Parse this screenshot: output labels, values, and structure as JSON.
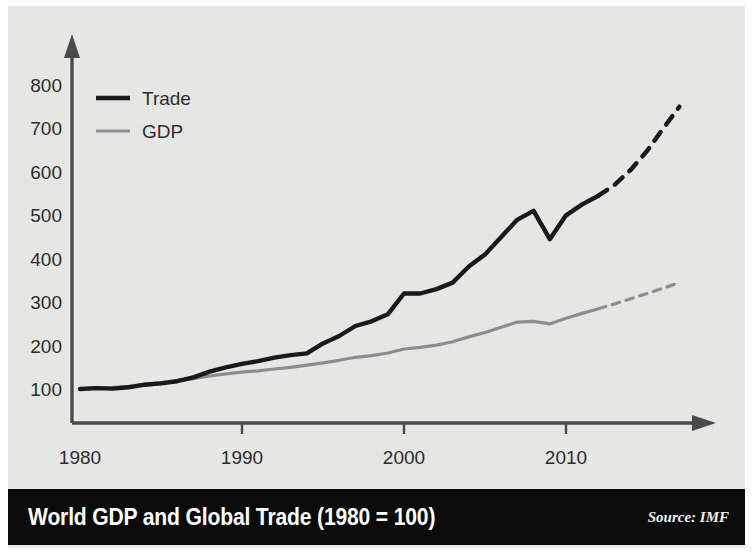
{
  "figure": {
    "title": "World GDP and Global Trade (1980 = 100)",
    "source": "Source: IMF",
    "background_color": "#e9e9e7",
    "title_bar_color": "#0b0b0b"
  },
  "chart_data": {
    "type": "line",
    "title": "World GDP and Global Trade (1980 = 100)",
    "subtitle": "",
    "xlabel": "",
    "ylabel": "",
    "xlim": [
      1980,
      2018
    ],
    "ylim": [
      0,
      850
    ],
    "xticks": [
      1980,
      1990,
      2000,
      2010
    ],
    "xtick_labels": [
      "1980",
      "1990",
      "2000",
      "2010"
    ],
    "yticks": [
      100,
      200,
      300,
      400,
      500,
      600,
      700,
      800
    ],
    "ytick_labels": [
      "100",
      "200",
      "300",
      "400",
      "500",
      "600",
      "700",
      "800"
    ],
    "grid": false,
    "legend_position": "upper-left",
    "note": "Index, 1980 = 100. Solid segments are historical; dashed segments are projections beginning 2012.",
    "series": [
      {
        "name": "Trade",
        "color": "#171717",
        "line_width": 4.2,
        "x": [
          1980,
          1981,
          1982,
          1983,
          1984,
          1985,
          1986,
          1987,
          1988,
          1989,
          1990,
          1991,
          1992,
          1993,
          1994,
          1995,
          1996,
          1997,
          1998,
          1999,
          2000,
          2001,
          2002,
          2003,
          2004,
          2005,
          2006,
          2007,
          2008,
          2009,
          2010,
          2011,
          2012
        ],
        "values": [
          100,
          101,
          100,
          102,
          108,
          111,
          116,
          124,
          134,
          144,
          152,
          158,
          167,
          178,
          181,
          196,
          207,
          225,
          233,
          244,
          265,
          268,
          274,
          288,
          312,
          320,
          323,
          330,
          340,
          352,
          362,
          372,
          385
        ],
        "dashed_from_index": 32
      },
      {
        "name": "GDP",
        "color": "#8e8e8e",
        "line_width": 3.0,
        "x": [
          1980,
          1981,
          1982,
          1983,
          1984,
          1985,
          1986,
          1987,
          1988,
          1989,
          1990,
          1991,
          1992,
          1993,
          1994,
          1995,
          1996,
          1997,
          1998,
          1999,
          2000,
          2001,
          2002,
          2003,
          2004,
          2005,
          2006,
          2007,
          2008,
          2009,
          2010,
          2011,
          2012
        ],
        "values": [
          100,
          101,
          101,
          103,
          107,
          110,
          113,
          117,
          122,
          126,
          130,
          132,
          135,
          138,
          142,
          146,
          150,
          155,
          158,
          163,
          169,
          172,
          176,
          182,
          190,
          197,
          205,
          213,
          216,
          213,
          224,
          232,
          240
        ],
        "dashed_from_index": 32
      }
    ],
    "trade_points": [
      {
        "year": 1980,
        "value": 100
      },
      {
        "year": 1981,
        "value": 102
      },
      {
        "year": 1982,
        "value": 101
      },
      {
        "year": 1983,
        "value": 104
      },
      {
        "year": 1984,
        "value": 110
      },
      {
        "year": 1985,
        "value": 113
      },
      {
        "year": 1986,
        "value": 118
      },
      {
        "year": 1987,
        "value": 127
      },
      {
        "year": 1988,
        "value": 140
      },
      {
        "year": 1989,
        "value": 150
      },
      {
        "year": 1990,
        "value": 158
      },
      {
        "year": 1991,
        "value": 164
      },
      {
        "year": 1992,
        "value": 172
      },
      {
        "year": 1993,
        "value": 178
      },
      {
        "year": 1994,
        "value": 182
      },
      {
        "year": 1995,
        "value": 205
      },
      {
        "year": 1996,
        "value": 222
      },
      {
        "year": 1997,
        "value": 245
      },
      {
        "year": 1998,
        "value": 256
      },
      {
        "year": 1999,
        "value": 272
      },
      {
        "year": 2000,
        "value": 320
      },
      {
        "year": 2001,
        "value": 320
      },
      {
        "year": 2002,
        "value": 330
      },
      {
        "year": 2003,
        "value": 345
      },
      {
        "year": 2004,
        "value": 382
      },
      {
        "year": 2005,
        "value": 410
      },
      {
        "year": 2006,
        "value": 450
      },
      {
        "year": 2007,
        "value": 490
      },
      {
        "year": 2008,
        "value": 510
      },
      {
        "year": 2009,
        "value": 445
      },
      {
        "year": 2010,
        "value": 500
      },
      {
        "year": 2011,
        "value": 525
      },
      {
        "year": 2012,
        "value": 545
      },
      {
        "year": 2013,
        "value": 570
      },
      {
        "year": 2014,
        "value": 605
      },
      {
        "year": 2015,
        "value": 648
      },
      {
        "year": 2016,
        "value": 700
      },
      {
        "year": 2017,
        "value": 750
      }
    ],
    "gdp_points": [
      {
        "year": 1980,
        "value": 100
      },
      {
        "year": 1981,
        "value": 102
      },
      {
        "year": 1982,
        "value": 103
      },
      {
        "year": 1983,
        "value": 106
      },
      {
        "year": 1984,
        "value": 111
      },
      {
        "year": 1985,
        "value": 115
      },
      {
        "year": 1986,
        "value": 119
      },
      {
        "year": 1987,
        "value": 124
      },
      {
        "year": 1988,
        "value": 130
      },
      {
        "year": 1989,
        "value": 135
      },
      {
        "year": 1990,
        "value": 139
      },
      {
        "year": 1991,
        "value": 142
      },
      {
        "year": 1992,
        "value": 146
      },
      {
        "year": 1993,
        "value": 150
      },
      {
        "year": 1994,
        "value": 155
      },
      {
        "year": 1995,
        "value": 160
      },
      {
        "year": 1996,
        "value": 166
      },
      {
        "year": 1997,
        "value": 173
      },
      {
        "year": 1998,
        "value": 177
      },
      {
        "year": 1999,
        "value": 183
      },
      {
        "year": 2000,
        "value": 192
      },
      {
        "year": 2001,
        "value": 196
      },
      {
        "year": 2002,
        "value": 201
      },
      {
        "year": 2003,
        "value": 209
      },
      {
        "year": 2004,
        "value": 220
      },
      {
        "year": 2005,
        "value": 230
      },
      {
        "year": 2006,
        "value": 242
      },
      {
        "year": 2007,
        "value": 254
      },
      {
        "year": 2008,
        "value": 256
      },
      {
        "year": 2009,
        "value": 250
      },
      {
        "year": 2010,
        "value": 263
      },
      {
        "year": 2011,
        "value": 274
      },
      {
        "year": 2012,
        "value": 285
      },
      {
        "year": 2013,
        "value": 296
      },
      {
        "year": 2014,
        "value": 308
      },
      {
        "year": 2015,
        "value": 320
      },
      {
        "year": 2016,
        "value": 332
      },
      {
        "year": 2017,
        "value": 345
      }
    ],
    "projection_start_year": 2012,
    "legend": [
      {
        "label": "Trade",
        "color": "#171717",
        "style": "solid"
      },
      {
        "label": "GDP",
        "color": "#8e8e8e",
        "style": "solid"
      }
    ]
  }
}
